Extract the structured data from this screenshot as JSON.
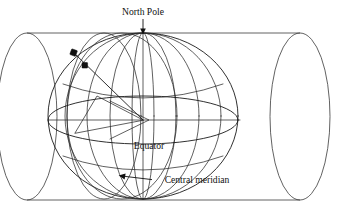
{
  "figure": {
    "background_color": "#ffffff",
    "line_color": "#1a1a1a",
    "labels": {
      "north_pole": "North Pole",
      "equator": "Equator",
      "central_meridian": "Central meridian"
    },
    "annotations": [
      {
        "name": "north-pole-label",
        "text": "North Pole",
        "text_x": 143,
        "text_y": 13,
        "anchor": "middle",
        "leader": "vertical arrow pointing down to the top of the sphere",
        "arrow_from": [
          143,
          19
        ],
        "arrow_to": [
          143,
          34
        ]
      },
      {
        "name": "equator-label",
        "text": "Equator",
        "text_x": 149,
        "text_y": 147,
        "anchor": "middle",
        "leader": "none"
      },
      {
        "name": "central-meridian-label",
        "text": "Central meridian",
        "text_x": 197,
        "text_y": 181,
        "anchor": "middle",
        "leader": "arrow pointing left to the central meridian arc",
        "arrow_from": [
          153,
          180
        ],
        "arrow_to": [
          119,
          175
        ]
      }
    ],
    "geometry": {
      "sphere": {
        "center": [
          143,
          120
        ],
        "radius_x": 95,
        "radius_y": 83,
        "north_pole": [
          143,
          34
        ],
        "south_pole": [
          143,
          198
        ],
        "meridian_longitudes_rx": [
          95,
          66,
          38,
          10,
          -22,
          -52,
          -78
        ],
        "equator_ellipse": {
          "cx": 143,
          "cy": 120,
          "rx": 95,
          "ry": 24
        },
        "parallel_ellipses": [
          {
            "cy": 78,
            "rx": 80,
            "ry": 20
          },
          {
            "cy": 162,
            "rx": 80,
            "ry": 20
          }
        ]
      },
      "cylinder": {
        "top_line_y": 33,
        "bottom_line_y": 200,
        "left_x": 27,
        "right_x": 300,
        "left_ellipse": {
          "cx": 27,
          "cy": 116.5,
          "rx": 30,
          "ry": 83.5
        },
        "right_ellipse": {
          "cx": 300,
          "cy": 116.5,
          "rx": 30,
          "ry": 83.5
        }
      },
      "projection_ray": {
        "from_center": [
          143,
          120
        ],
        "surface_point": [
          85,
          66
        ],
        "cylinder_point": [
          74,
          53
        ],
        "description": "ray from sphere centre through a surface point onto the cylinder wall"
      },
      "markers": [
        {
          "name": "cylinder-projection-point",
          "x": 74,
          "y": 53
        },
        {
          "name": "sphere-surface-point",
          "x": 85,
          "y": 66
        }
      ],
      "axis_line": {
        "from": [
          48,
          120
        ],
        "to": [
          240,
          120
        ]
      },
      "polar_axis": {
        "from": [
          143,
          34
        ],
        "to": [
          143,
          198
        ]
      }
    }
  }
}
